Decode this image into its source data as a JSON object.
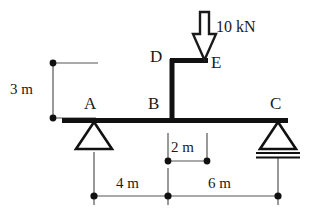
{
  "diagram": {
    "type": "structural-beam-free-body-diagram",
    "joints": [
      {
        "id": "A",
        "label": "A",
        "x": 94,
        "y": 120,
        "support": "pin"
      },
      {
        "id": "B",
        "label": "B",
        "x": 168,
        "y": 120,
        "support": "none"
      },
      {
        "id": "C",
        "label": "C",
        "x": 278,
        "y": 120,
        "support": "roller"
      },
      {
        "id": "D",
        "label": "D",
        "x": 172,
        "y": 60,
        "support": "none"
      },
      {
        "id": "E",
        "label": "E",
        "x": 207,
        "y": 60,
        "support": "none"
      }
    ],
    "members": [
      {
        "from": "A",
        "to": "C",
        "orientation": "horizontal",
        "name": "main-beam"
      },
      {
        "from": "B",
        "to": "D",
        "orientation": "vertical",
        "name": "column-bd"
      },
      {
        "from": "D",
        "to": "E",
        "orientation": "horizontal",
        "name": "bracket-de"
      }
    ],
    "loads": [
      {
        "name": "point-load-E",
        "magnitude": "10",
        "unit": "kN",
        "label": "10 kN",
        "direction": "down",
        "applied_at": "E"
      }
    ],
    "supports": [
      {
        "at": "A",
        "kind": "pin",
        "label": "pin-support"
      },
      {
        "at": "C",
        "kind": "roller",
        "label": "roller-support"
      }
    ],
    "dimensions": [
      {
        "name": "height-ab",
        "label": "3 m",
        "value": 3,
        "unit": "m",
        "orientation": "vertical",
        "from": "beam-level",
        "to": "bracket-level"
      },
      {
        "name": "span-ab",
        "label": "4 m",
        "value": 4,
        "unit": "m",
        "orientation": "horizontal",
        "from": "A",
        "to": "B"
      },
      {
        "name": "span-bc",
        "label": "6 m",
        "value": 6,
        "unit": "m",
        "orientation": "horizontal",
        "from": "B",
        "to": "C"
      },
      {
        "name": "offset-be",
        "label": "2 m",
        "value": 2,
        "unit": "m",
        "orientation": "horizontal",
        "from": "B",
        "to": "E"
      }
    ],
    "colors": {
      "ink": "#1a1a1a",
      "member": "#111111",
      "dimension_line": "#555555",
      "background": "#ffffff"
    }
  }
}
